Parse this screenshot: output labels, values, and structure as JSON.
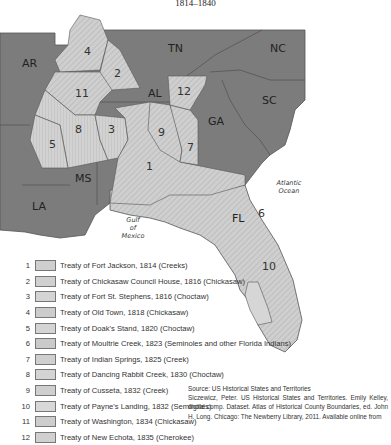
{
  "title": {
    "years": "1814–1840"
  },
  "map": {
    "states": [
      "AR",
      "TN",
      "NC",
      "AL",
      "SC",
      "GA",
      "MS",
      "LA",
      "FL"
    ],
    "water": {
      "gulf": [
        "Gulf",
        "of",
        "Mexico"
      ],
      "atlantic": [
        "Atlantic",
        "Ocean"
      ]
    },
    "region_numbers": [
      "1",
      "2",
      "3",
      "4",
      "5",
      "6",
      "7",
      "8",
      "9",
      "10",
      "11",
      "12"
    ],
    "colors": {
      "state": "#7a7a7a",
      "cession": "#c8c8c8",
      "border": "#555555",
      "background": "#ffffff"
    }
  },
  "legend": {
    "items": [
      {
        "num": "1",
        "label": "Treaty of Fort Jackson, 1814 (Creeks)"
      },
      {
        "num": "2",
        "label": "Treaty of Chickasaw Council House, 1816 (Chickasaw)"
      },
      {
        "num": "3",
        "label": "Treaty of Fort St. Stephens, 1816 (Choctaw)"
      },
      {
        "num": "4",
        "label": "Treaty of Old Town, 1818 (Chickasaw)"
      },
      {
        "num": "5",
        "label": "Treaty of Doak's Stand, 1820 (Choctaw)"
      },
      {
        "num": "6",
        "label": "Treaty of Moultrie Creek, 1823 (Seminoles and other Florida Indians)"
      },
      {
        "num": "7",
        "label": "Treaty of Indian Springs, 1825 (Creek)"
      },
      {
        "num": "8",
        "label": "Treaty of Dancing Rabbit Creek, 1830 (Choctaw)"
      },
      {
        "num": "9",
        "label": "Treaty of Cusseta, 1832 (Creek)"
      },
      {
        "num": "10",
        "label": "Treaty of Payne's Landing, 1832 (Seminoles)"
      },
      {
        "num": "11",
        "label": "Treaty of Washington, 1834 (Chickasaw)"
      },
      {
        "num": "12",
        "label": "Treaty of New Echota, 1835 (Cherokee)"
      }
    ]
  },
  "source": {
    "line1": "Source: US Historical States and Territories",
    "line2": "Siczewicz, Peter. US Historical States and Territories. Emily Kelley, digital comp. Dataset. Atlas of Historical County Boundaries, ed. John H. Long. Chicago: The Newberry Library, 2011. Available online from"
  }
}
